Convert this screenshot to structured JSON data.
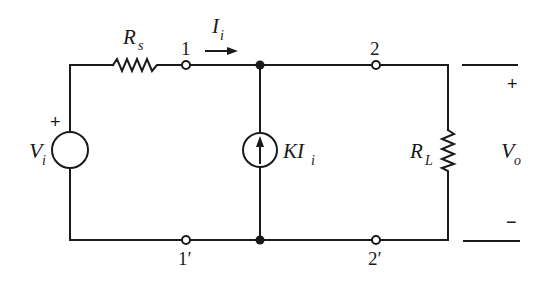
{
  "diagram": {
    "type": "circuit-schematic",
    "components": {
      "source_voltage": {
        "label": "V",
        "subscript": "i",
        "polarity_plus": "+"
      },
      "source_resistor": {
        "label": "R",
        "subscript": "s"
      },
      "dependent_source": {
        "label": "KI",
        "subscript": "i",
        "direction": "up"
      },
      "load_resistor": {
        "label": "R",
        "subscript": "L"
      },
      "input_current": {
        "label": "I",
        "subscript": "i",
        "direction": "right"
      },
      "output_voltage": {
        "label": "V",
        "subscript": "o",
        "plus": "+",
        "minus": "−"
      }
    },
    "terminals": {
      "t1": "1",
      "t1p": "1′",
      "t2": "2",
      "t2p": "2′"
    }
  }
}
